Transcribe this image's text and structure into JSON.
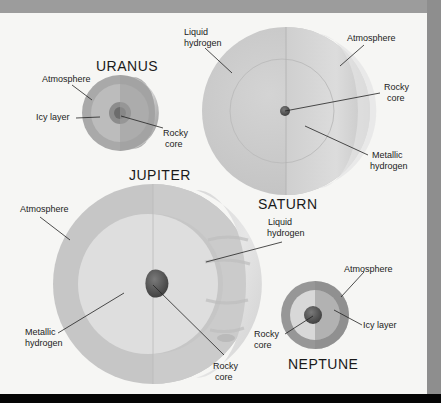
{
  "diagram": {
    "colors": {
      "page_background": "#f6f6f4",
      "outer_frame": "#9a9a9a",
      "bottom_bar": "#050505",
      "leader_line": "#222222"
    },
    "planets": {
      "uranus": {
        "name": "URANUS",
        "labels": {
          "atmosphere": "Atmosphere",
          "icy_layer": "Icy layer",
          "rocky_core_1": "Rocky",
          "rocky_core_2": "core"
        }
      },
      "saturn": {
        "name": "SATURN",
        "labels": {
          "liquid_hydrogen_1": "Liquid",
          "liquid_hydrogen_2": "hydrogen",
          "atmosphere": "Atmosphere",
          "rocky_core_1": "Rocky",
          "rocky_core_2": "core",
          "metallic_hydrogen_1": "Metallic",
          "metallic_hydrogen_2": "hydrogen"
        }
      },
      "jupiter": {
        "name": "JUPITER",
        "labels": {
          "atmosphere": "Atmosphere",
          "liquid_hydrogen_1": "Liquid",
          "liquid_hydrogen_2": "hydrogen",
          "metallic_hydrogen_1": "Metallic",
          "metallic_hydrogen_2": "hydrogen",
          "rocky_core_1": "Rocky",
          "rocky_core_2": "core"
        }
      },
      "neptune": {
        "name": "NEPTUNE",
        "labels": {
          "atmosphere": "Atmosphere",
          "icy_layer": "Icy layer",
          "rocky_core_1": "Rocky",
          "rocky_core_2": "core"
        }
      }
    }
  }
}
